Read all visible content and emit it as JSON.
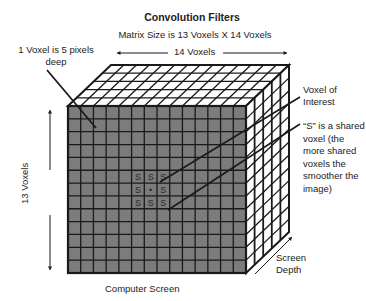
{
  "title": "Convolution Filters",
  "subtitle": "Matrix Size is 13 Voxels X 14 Voxels",
  "labels": {
    "width": "14 Voxels",
    "height": "13 Voxels",
    "voxel_depth": "1 Voxel is 5 pixels deep",
    "voxel_of_interest": "Voxel of Interest",
    "shared_voxel": "“S” is a shared voxel (the more shared voxels the smoother the image)",
    "computer_screen": "Computer Screen",
    "screen_depth": "Screen Depth"
  },
  "matrix": {
    "rows": 13,
    "cols": 14,
    "depth": 5
  },
  "kernel": {
    "marker": "S",
    "center_marker": "•",
    "grid": [
      [
        "S",
        "S",
        "S"
      ],
      [
        "S",
        "•",
        "S"
      ],
      [
        "S",
        "S",
        "S"
      ]
    ]
  },
  "colors": {
    "front_face": "#7c7c7c",
    "grid_line": "#1a1a1a",
    "side_face": "#ffffff"
  }
}
